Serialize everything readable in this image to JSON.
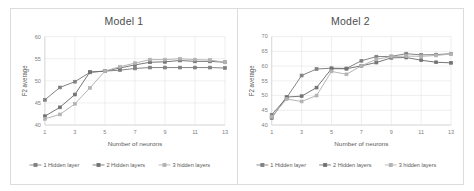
{
  "figure": {
    "panels": [
      "left",
      "right"
    ]
  },
  "chart_data": [
    {
      "type": "line",
      "title": "Model 1",
      "xlabel": "Number of neurons",
      "ylabel": "F2 average",
      "x": [
        1,
        2,
        3,
        4,
        5,
        6,
        7,
        8,
        9,
        10,
        11,
        12,
        13
      ],
      "xticks": [
        1,
        3,
        5,
        7,
        9,
        11,
        13
      ],
      "xlim": [
        1,
        13
      ],
      "yticks": [
        40,
        45,
        50,
        55,
        60
      ],
      "ylim": [
        40,
        60
      ],
      "grid": true,
      "legend_position": "bottom",
      "series": [
        {
          "name": "1 Hidden layer",
          "color": "#808080",
          "values": [
            45.7,
            48.5,
            49.8,
            51.9,
            52.2,
            52.4,
            52.8,
            53.0,
            53.0,
            53.0,
            53.0,
            53.0,
            52.9
          ]
        },
        {
          "name": "2 Hidden layers",
          "color": "#737373",
          "values": [
            42.0,
            44.0,
            46.9,
            52.0,
            52.2,
            52.9,
            53.6,
            54.2,
            54.3,
            54.6,
            54.4,
            54.4,
            54.2
          ]
        },
        {
          "name": "3 hidden layers",
          "color": "#b3b3b3",
          "values": [
            41.4,
            42.4,
            44.8,
            48.4,
            52.2,
            53.2,
            54.0,
            54.8,
            54.8,
            55.0,
            54.8,
            54.7,
            54.2
          ]
        }
      ]
    },
    {
      "type": "line",
      "title": "Model 2",
      "xlabel": "Number of neurons",
      "ylabel": "F2 average",
      "x": [
        1,
        2,
        3,
        4,
        5,
        6,
        7,
        8,
        9,
        10,
        11,
        12,
        13
      ],
      "xticks": [
        1,
        3,
        5,
        7,
        9,
        11,
        13
      ],
      "xlim": [
        1,
        13
      ],
      "yticks": [
        40,
        45,
        50,
        55,
        60,
        65,
        70
      ],
      "ylim": [
        40,
        70
      ],
      "grid": true,
      "legend_position": "bottom",
      "series": [
        {
          "name": "1 Hidden layer",
          "color": "#808080",
          "values": [
            43.5,
            49.3,
            56.8,
            59.0,
            59.3,
            59.2,
            61.8,
            63.2,
            63.3,
            64.2,
            63.8,
            63.9,
            64.2
          ]
        },
        {
          "name": "2 Hidden layers",
          "color": "#737373",
          "values": [
            42.4,
            49.5,
            49.8,
            52.7,
            59.1,
            59.1,
            60.1,
            61.2,
            62.8,
            62.9,
            62.0,
            61.3,
            61.1
          ]
        },
        {
          "name": "3 hidden layers",
          "color": "#b3b3b3",
          "values": [
            42.8,
            48.8,
            48.0,
            50.0,
            58.2,
            57.2,
            60.1,
            62.3,
            63.2,
            63.4,
            63.3,
            63.6,
            64.1
          ]
        }
      ]
    }
  ]
}
